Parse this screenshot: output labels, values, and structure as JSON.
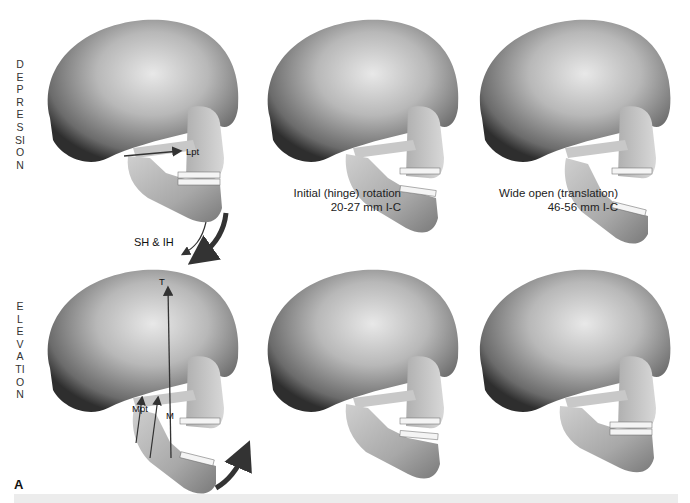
{
  "figure": {
    "letter": "A",
    "rows": [
      {
        "label": "DEPRESSION",
        "panels": [
          {
            "state": "closed",
            "annotations": {
              "muscle_label": "Lpt",
              "arrow_label": "SH & IH"
            }
          },
          {
            "state": "hinge",
            "caption_line1": "Initial (hinge) rotation",
            "caption_line2": "20-27 mm I-C"
          },
          {
            "state": "wide",
            "caption_line1": "Wide open (translation)",
            "caption_line2": "46-56 mm I-C"
          }
        ]
      },
      {
        "label": "ELEVATION",
        "panels": [
          {
            "state": "open",
            "annotations": {
              "label_t": "T",
              "label_mpt": "Mpt",
              "label_m": "M"
            }
          },
          {
            "state": "partial"
          },
          {
            "state": "closed"
          }
        ]
      }
    ]
  },
  "colors": {
    "bone_light": "#dcdcdc",
    "bone_mid": "#a9a9a9",
    "bone_dark": "#4a4a4a",
    "arrow": "#333333",
    "background": "#ffffff"
  }
}
